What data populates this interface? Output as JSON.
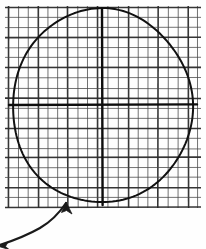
{
  "figure": {
    "title": "Circle on graph paper with axes and curved arrow annotation",
    "caption": "",
    "width": 206,
    "height": 249,
    "background_color": "#fefefe",
    "ink_color": "#1a1a1a",
    "grid_color": "#4a4a4a"
  },
  "grid": {
    "name": "graph-paper-grid",
    "cell_size": 10,
    "x_start": 8,
    "x_end": 198,
    "y_start": 8,
    "y_end": 206,
    "vertical_line_count": 20,
    "horizontal_line_count": 21,
    "minor_line_width": 1,
    "heavy_line_width": 1.6,
    "heavy_vertical_indices": [
      0,
      3,
      6,
      9,
      12,
      15,
      18
    ],
    "heavy_horizontal_indices": [
      0,
      3,
      6,
      9,
      12,
      15,
      18,
      20
    ],
    "color": "#4a4a4a",
    "heavy_color": "#2b2b2b"
  },
  "circle": {
    "name": "hand-drawn-circle",
    "center_x": 102,
    "center_y": 106,
    "radius_x": 90,
    "radius_y": 97,
    "stroke_width": 2.0,
    "color": "#111111"
  },
  "axes": {
    "name": "cross-axes",
    "stroke_width": 2.4,
    "color": "#0d0d0d",
    "vertical": {
      "label": "vertical-axis",
      "x": 102,
      "y_top": 9,
      "y_bottom": 205
    },
    "horizontal": {
      "label": "horizontal-axis",
      "y": 105,
      "x_left": 9,
      "x_right": 197
    }
  },
  "annotation_arrow": {
    "name": "curved-double-arrow",
    "description": "curved double-headed arrow at lower-left pointing toward the grid",
    "stroke_width": 2.2,
    "color": "#1a1a1a",
    "path": "M 1 243 C 10 239 22 234 34 228 C 46 222 56 213 64 222",
    "head_upper": {
      "x": 64,
      "y": 222,
      "angle": -50
    },
    "head_lower": {
      "x": 1,
      "y": 243,
      "angle": 150
    }
  }
}
